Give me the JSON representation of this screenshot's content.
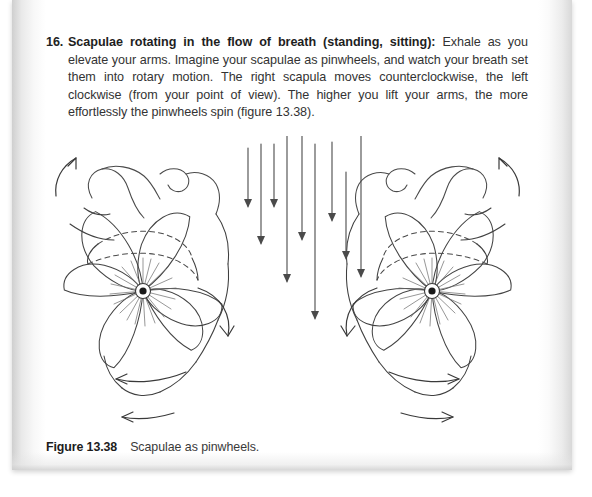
{
  "page": {
    "background_color": "#ffffff",
    "sheet_color": "#ffffff"
  },
  "instruction": {
    "number": "16.",
    "title": "Scapulae rotating in the flow of breath (standing, sitting):",
    "body": " Exhale as you elevate your arms. Imagine your scapulae as pinwheels, and watch your breath set them into rotary motion. The right scapula moves counterclockwise, the left clockwise (from your point of view). The higher you lift your arms, the more effortlessly the pinwheels spin (figure 13.38).",
    "text_color": "#333333",
    "title_color": "#1e1e1e"
  },
  "caption": {
    "label": "Figure 13.38",
    "text": "Scapulae as pinwheels.",
    "label_color": "#1c1c1c",
    "text_color": "#3a3a3a"
  },
  "figure": {
    "name": "scapulae-as-pinwheels-illustration",
    "ink_color": "#3c3c3c",
    "hub_color": "#1a1a1a",
    "left_pinwheel": {
      "label": "left-scapula-pinwheel",
      "rotation": "clockwise",
      "hub_x": 103,
      "hub_y": 155,
      "blade_count": 6
    },
    "right_pinwheel": {
      "label": "right-scapula-pinwheel",
      "rotation": "counterclockwise",
      "hub_x": 392,
      "hub_y": 155,
      "blade_count": 6
    },
    "breath_arrows": {
      "label": "breath-flow-arrows",
      "direction": "downward",
      "count": 8
    },
    "motion_arrows": {
      "label": "rotary-motion-arrows",
      "count": 8
    }
  }
}
